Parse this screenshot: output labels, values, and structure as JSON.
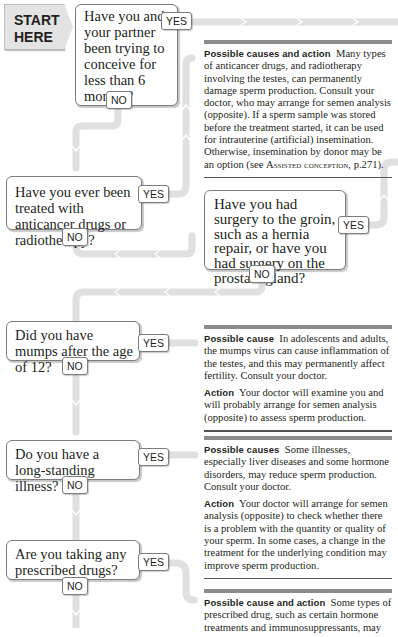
{
  "start": {
    "label_line1": "START",
    "label_line2": "HERE"
  },
  "questions": [
    {
      "id": "q1",
      "text": "Have you and your partner been trying to conceive for less than 6 months?",
      "yes": "YES",
      "no": "NO"
    },
    {
      "id": "q2",
      "text": "Have you ever been treated with anticancer drugs or radiotherapy?",
      "yes": "YES",
      "no": "NO"
    },
    {
      "id": "q3",
      "text": "Have you had surgery to the groin, such as a hernia repair, or have you had surgery on the prostate gland?",
      "yes": "YES",
      "no": "NO"
    },
    {
      "id": "q4",
      "text": "Did you have mumps after the age of 12?",
      "yes": "YES",
      "no": "NO"
    },
    {
      "id": "q5",
      "text": "Do you have a long-standing illness?",
      "yes": "YES",
      "no": "NO"
    },
    {
      "id": "q6",
      "text": "Are you taking any prescribed drugs?",
      "yes": "YES",
      "no": "NO"
    }
  ],
  "info": {
    "anticancer": {
      "heading": "Possible causes and action",
      "body": "Many types of anticancer drugs, and radiotherapy involving the testes, can permanently damage sperm production. Consult your doctor, who may arrange for semen analysis (opposite). If a sperm sample was stored before the treatment started, it can be used for intrauterine (artificial) insemination. Otherwise, insemination by donor may be an option (see ",
      "ref": "Assisted conception",
      "ref_suffix": ", p.271)."
    },
    "mumps": {
      "cause_heading": "Possible cause",
      "cause_body": "In adolescents and adults, the mumps virus can cause inflammation of the testes, and this may permanently affect fertility. Consult your doctor.",
      "action_heading": "Action",
      "action_body": "Your doctor will examine you and will probably arrange for semen analysis (opposite) to assess sperm production."
    },
    "illness": {
      "cause_heading": "Possible causes",
      "cause_body": "Some illnesses, especially liver diseases and some hormone disorders, may reduce sperm production. Consult your doctor.",
      "action_heading": "Action",
      "action_body": "Your doctor will arrange for semen analysis (opposite) to check whether there is a problem with the quantity or quality of your sperm. In some cases, a change in the treatment for the underlying condition may improve sperm production."
    },
    "drugs": {
      "heading": "Possible cause and action",
      "body": "Some types of prescribed drug, such as certain hormone treatments and immunosuppressants, may"
    }
  },
  "colors": {
    "path": "#e0e0e0",
    "border": "#7d7d7d",
    "start_bg": "#e3e3e3",
    "rule": "#8c8c8c"
  }
}
